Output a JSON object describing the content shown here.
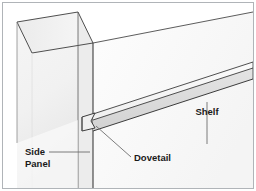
{
  "figure": {
    "type": "technical-illustration",
    "background_color": "#ffffff",
    "border_color": "#b0b4b8",
    "line_color": "#3c3c3c",
    "panel_face_color": "#f2f2f2",
    "panel_edge_color": "#e2e2e2",
    "shelf_face_color": "#ededed",
    "shelf_edge_color": "#d9d9d9",
    "back_panel_color": "#fcfcfc",
    "leader_color": "#6e6e6e"
  },
  "labels": {
    "side_panel": "Side\nPanel",
    "side_panel_line1": "Side",
    "side_panel_line2": "Panel",
    "dovetail": "Dovetail",
    "shelf": "Shelf"
  },
  "parts": [
    {
      "name": "side-panel",
      "label": "Side Panel"
    },
    {
      "name": "shelf",
      "label": "Shelf"
    },
    {
      "name": "dovetail-joint",
      "label": "Dovetail"
    },
    {
      "name": "back-panel",
      "label": ""
    }
  ]
}
